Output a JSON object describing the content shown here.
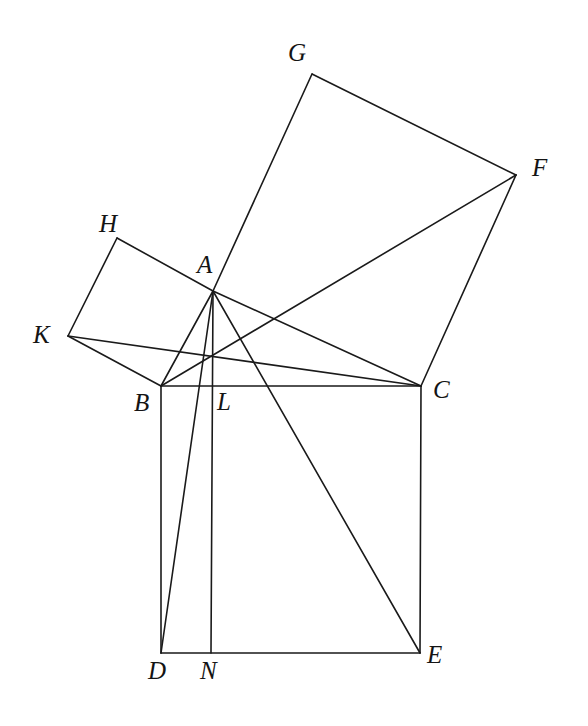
{
  "figure": {
    "canvas": {
      "width": 588,
      "height": 726
    },
    "stroke_color": "#1a1a1a",
    "background_color": "#ffffff",
    "label_color": "#141414",
    "stroke_width": 1.6,
    "label_font_size": 25
  },
  "points": {
    "A": {
      "label": "A",
      "x": 213,
      "y": 291,
      "label_x": 197,
      "label_y": 252
    },
    "B": {
      "label": "B",
      "x": 161,
      "y": 386,
      "label_x": 134,
      "label_y": 390
    },
    "C": {
      "label": "C",
      "x": 421,
      "y": 386,
      "label_x": 433,
      "label_y": 377
    },
    "D": {
      "label": "D",
      "x": 161,
      "y": 653,
      "label_x": 148,
      "label_y": 658
    },
    "E": {
      "label": "E",
      "x": 420,
      "y": 653,
      "label_x": 427,
      "label_y": 642
    },
    "F": {
      "label": "F",
      "x": 516,
      "y": 175,
      "label_x": 532,
      "label_y": 155
    },
    "G": {
      "label": "G",
      "x": 312,
      "y": 74,
      "label_x": 288,
      "label_y": 40
    },
    "H": {
      "label": "H",
      "x": 117,
      "y": 238,
      "label_x": 99,
      "label_y": 211
    },
    "K": {
      "label": "K",
      "x": 68,
      "y": 336,
      "label_x": 33,
      "label_y": 322
    },
    "L": {
      "label": "L",
      "x": 211,
      "y": 386,
      "label_x": 217,
      "label_y": 389
    },
    "N": {
      "label": "N",
      "x": 211,
      "y": 653,
      "label_x": 200,
      "label_y": 658
    }
  },
  "segments": [
    {
      "name": "segment-AB",
      "from": "A",
      "to": "B"
    },
    {
      "name": "segment-AC",
      "from": "A",
      "to": "C"
    },
    {
      "name": "segment-BC",
      "from": "B",
      "to": "C"
    },
    {
      "name": "segment-BD",
      "from": "B",
      "to": "D"
    },
    {
      "name": "segment-DE",
      "from": "D",
      "to": "E"
    },
    {
      "name": "segment-EC",
      "from": "E",
      "to": "C"
    },
    {
      "name": "segment-CF",
      "from": "C",
      "to": "F"
    },
    {
      "name": "segment-FG",
      "from": "F",
      "to": "G"
    },
    {
      "name": "segment-GA",
      "from": "G",
      "to": "A"
    },
    {
      "name": "segment-AH",
      "from": "A",
      "to": "H"
    },
    {
      "name": "segment-HK",
      "from": "H",
      "to": "K"
    },
    {
      "name": "segment-KB",
      "from": "K",
      "to": "B"
    },
    {
      "name": "segment-AD",
      "from": "A",
      "to": "D"
    },
    {
      "name": "segment-AE",
      "from": "A",
      "to": "E"
    },
    {
      "name": "segment-AN-altitude",
      "from": "A",
      "to": "N"
    },
    {
      "name": "segment-BF",
      "from": "B",
      "to": "F"
    },
    {
      "name": "segment-KC",
      "from": "K",
      "to": "C"
    }
  ],
  "figure_elements": {
    "square_on_hypotenuse": [
      "B",
      "C",
      "E",
      "D"
    ],
    "square_on_leg_ac": [
      "A",
      "C",
      "F",
      "G"
    ],
    "square_on_leg_ab": [
      "A",
      "B",
      "K",
      "H"
    ],
    "right_triangle": [
      "A",
      "B",
      "C"
    ]
  }
}
